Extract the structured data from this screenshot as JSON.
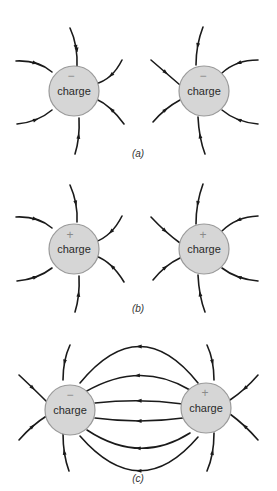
{
  "diagram": {
    "panels": [
      {
        "id": "a",
        "caption": "(a)",
        "charges": [
          {
            "sign": "−",
            "label": "charge",
            "field_direction": "inward"
          },
          {
            "sign": "−",
            "label": "charge",
            "field_direction": "inward"
          }
        ]
      },
      {
        "id": "b",
        "caption": "(b)",
        "charges": [
          {
            "sign": "+",
            "label": "charge",
            "field_direction": "outward"
          },
          {
            "sign": "+",
            "label": "charge",
            "field_direction": "outward"
          }
        ]
      },
      {
        "id": "c",
        "caption": "(c)",
        "charges": [
          {
            "sign": "−",
            "label": "charge",
            "field_direction": "inward"
          },
          {
            "sign": "+",
            "label": "charge",
            "field_direction": "outward"
          }
        ],
        "connecting_lines": 6
      }
    ]
  }
}
